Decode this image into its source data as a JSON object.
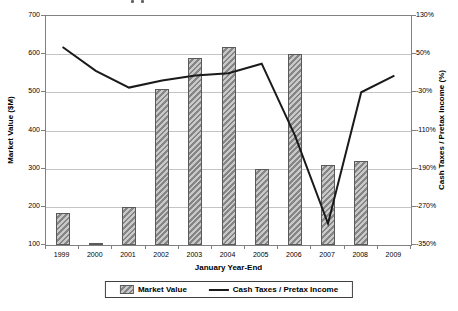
{
  "chart_data": {
    "type": "bar",
    "subtype": "combo-bar-line",
    "categories": [
      "1999",
      "2000",
      "2001",
      "2002",
      "2003",
      "2004",
      "2005",
      "2006",
      "2007",
      "2008",
      "2009"
    ],
    "series": [
      {
        "name": "Market Value",
        "type": "bar",
        "axis": "left",
        "values": [
          185,
          102,
          200,
          510,
          590,
          620,
          300,
          600,
          310,
          320,
          null
        ]
      },
      {
        "name": "Cash Taxes / Pretax Income",
        "type": "line",
        "axis": "right",
        "values": [
          65,
          15,
          -20,
          -5,
          5,
          10,
          30,
          -120,
          -305,
          -30,
          5
        ]
      }
    ],
    "xlabel": "January Year-End",
    "left_axis": {
      "label": "Market Value ($M)",
      "min": 100,
      "max": 700,
      "tick_step": 100,
      "ticks": [
        "700",
        "600",
        "500",
        "400",
        "300",
        "200",
        "100"
      ]
    },
    "right_axis": {
      "label": "Cash Taxes / Pretax Income (%)",
      "min": -350,
      "max": 130,
      "tick_step": 80,
      "ticks": [
        "130%",
        "50%",
        "-30%",
        "-110%",
        "-190%",
        "-270%",
        "-350%"
      ]
    },
    "legend": {
      "position": "bottom",
      "items": [
        "Market Value",
        "Cash Taxes / Pretax Income"
      ]
    },
    "grid": "horizontal",
    "colors": {
      "bar_fill": "#c9c9c9",
      "bar_hatch": "#858585",
      "bar_border": "#5a5a5a",
      "line": "#1a1a1a",
      "grid": "#c4c4c4",
      "axis_border": "#808080",
      "text": "#000000",
      "background": "#ffffff"
    }
  }
}
